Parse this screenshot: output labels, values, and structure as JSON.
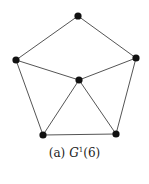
{
  "figure": {
    "caption_prefix": "(a)",
    "caption_symbol": "G",
    "caption_superscript": "1",
    "caption_arg": "(6)"
  },
  "graph": {
    "node_color": "#111111",
    "edge_color": "#555555",
    "nodes": [
      {
        "id": "top",
        "x": 78,
        "y": 16
      },
      {
        "id": "left",
        "x": 16,
        "y": 60
      },
      {
        "id": "right",
        "x": 136,
        "y": 58
      },
      {
        "id": "center",
        "x": 79,
        "y": 80
      },
      {
        "id": "bottom-left",
        "x": 43,
        "y": 135
      },
      {
        "id": "bottom-right",
        "x": 116,
        "y": 134
      }
    ],
    "edges": [
      [
        "top",
        "left"
      ],
      [
        "top",
        "right"
      ],
      [
        "left",
        "center"
      ],
      [
        "right",
        "center"
      ],
      [
        "left",
        "bottom-left"
      ],
      [
        "right",
        "bottom-right"
      ],
      [
        "center",
        "bottom-left"
      ],
      [
        "center",
        "bottom-right"
      ],
      [
        "bottom-left",
        "bottom-right"
      ]
    ]
  }
}
